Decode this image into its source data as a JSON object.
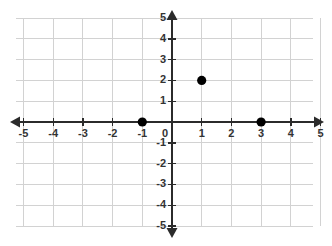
{
  "chart_data": {
    "type": "scatter",
    "title": "",
    "xlabel": "",
    "ylabel": "",
    "xlim": [
      -5,
      5
    ],
    "ylim": [
      -5,
      5
    ],
    "grid": true,
    "legend": "none",
    "x_ticks": [
      -5,
      -4,
      -3,
      -2,
      -1,
      0,
      1,
      2,
      3,
      4,
      5
    ],
    "y_ticks": [
      -5,
      -4,
      -3,
      -2,
      -1,
      0,
      1,
      2,
      3,
      4,
      5
    ],
    "x_tick_labels": [
      "-5",
      "-4",
      "-3",
      "-2",
      "-1",
      "0",
      "1",
      "2",
      "3",
      "4",
      "5"
    ],
    "y_tick_labels": [
      "-5",
      "-4",
      "-3",
      "-2",
      "-1",
      "0",
      "1",
      "2",
      "3",
      "4",
      "5"
    ],
    "points": [
      {
        "x": -1,
        "y": 0,
        "label": "(-1, 0)"
      },
      {
        "x": 1,
        "y": 2,
        "label": "(1, 2)"
      },
      {
        "x": 3,
        "y": 0,
        "label": "(3, 0)"
      }
    ],
    "point_color": "#000000",
    "axis_color": "#2b2b2b",
    "grid_color": "#d2d2d2",
    "background_color": "#ffffff",
    "origin_label": "0"
  },
  "geometry": {
    "width": 332,
    "height": 246,
    "origin_x": 172,
    "origin_y": 122,
    "unit_x": 29.7,
    "unit_y": 20.8,
    "grid_left": 16,
    "grid_right": 313,
    "grid_top": 18,
    "grid_bottom": 226,
    "axis_x_start": 10,
    "axis_x_end": 324,
    "axis_y_start": 10,
    "axis_y_end": 238,
    "point_radius": 4.6
  }
}
